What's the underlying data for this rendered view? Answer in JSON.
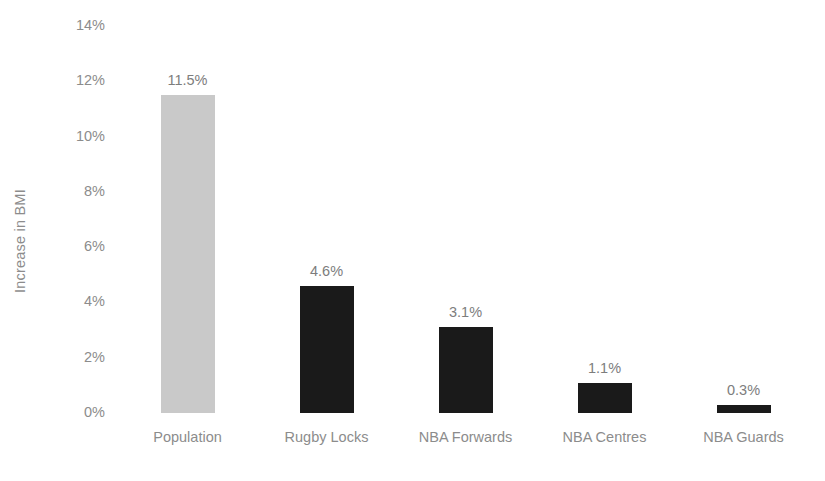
{
  "chart_data": {
    "type": "bar",
    "title": "",
    "subtitle": "",
    "xlabel": "",
    "ylabel": "Increase in BMI",
    "categories": [
      "Population",
      "Rugby Locks",
      "NBA Forwards",
      "NBA Centres",
      "NBA Guards"
    ],
    "values": [
      11.5,
      4.6,
      3.1,
      1.1,
      0.3
    ],
    "data_labels": [
      "11.5%",
      "4.6%",
      "3.1%",
      "1.1%",
      "0.3%"
    ],
    "ylim": [
      0,
      14
    ],
    "y_tick_values": [
      0,
      2,
      4,
      6,
      8,
      10,
      12,
      14
    ],
    "y_tick_labels": [
      "0%",
      "2%",
      "4%",
      "6%",
      "8%",
      "10%",
      "12%",
      "14%"
    ],
    "grid": false,
    "legend": "none",
    "bar_colors": [
      "#c9c9c9",
      "#1a1a1a",
      "#1a1a1a",
      "#1a1a1a",
      "#1a1a1a"
    ],
    "label_color": "#7d7d7d",
    "axis_text_color": "#8c8c8c",
    "background_color": "#ffffff"
  }
}
